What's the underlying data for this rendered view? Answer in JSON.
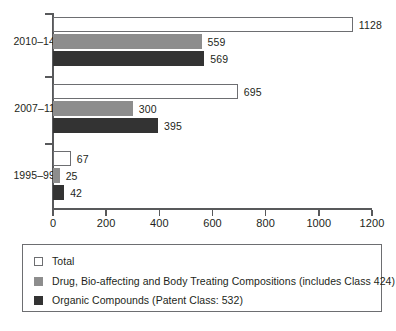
{
  "chart_data": {
    "type": "bar",
    "orientation": "horizontal",
    "title": "",
    "xlabel": "",
    "ylabel": "",
    "categories": [
      "2010–14",
      "2007–11",
      "1995–99"
    ],
    "series": [
      {
        "name": "Total",
        "key": "total",
        "color": "#ffffff",
        "border_color": "#6d6e71",
        "values": [
          1128,
          695,
          67
        ]
      },
      {
        "name": "Drug, Bio-affecting and Body Treating Compositions (includes Class 424)",
        "key": "drug",
        "color": "#8d8d8d",
        "border_color": "#8d8d8d",
        "values": [
          559,
          300,
          25
        ]
      },
      {
        "name": "Organic Compounds (Patent Class: 532)",
        "key": "organic",
        "color": "#333333",
        "border_color": "#333333",
        "values": [
          569,
          395,
          42
        ]
      }
    ],
    "xlim": [
      0,
      1200
    ],
    "xticks": [
      0,
      200,
      400,
      600,
      800,
      1000,
      1200
    ],
    "xtick_labels": [
      "0",
      "200",
      "400",
      "600",
      "800",
      "1000",
      "1200"
    ],
    "grid": false,
    "legend_position": "bottom",
    "data_labels": {
      "2010–14": {
        "total": "1128",
        "drug": "559",
        "organic": "569"
      },
      "2007–11": {
        "total": "695",
        "drug": "300",
        "organic": "395"
      },
      "1995–99": {
        "total": "67",
        "drug": "25",
        "organic": "42"
      }
    }
  },
  "axis": {
    "x_tick_labels": [
      "0",
      "200",
      "400",
      "600",
      "800",
      "1000",
      "1200"
    ],
    "y_group_labels": [
      "2010–14",
      "2007–11",
      "1995–99"
    ]
  },
  "legend": {
    "items": [
      {
        "swatch": "total",
        "label": "Total"
      },
      {
        "swatch": "drug",
        "label": "Drug, Bio-affecting and Body Treating Compositions (includes Class 424)"
      },
      {
        "swatch": "organic",
        "label": "Organic Compounds (Patent Class: 532)"
      }
    ]
  },
  "colors": {
    "total": "#ffffff",
    "drug": "#8d8d8d",
    "organic": "#333333",
    "axis": "#58595b",
    "text": "#231f20",
    "outline": "#6d6e71"
  }
}
